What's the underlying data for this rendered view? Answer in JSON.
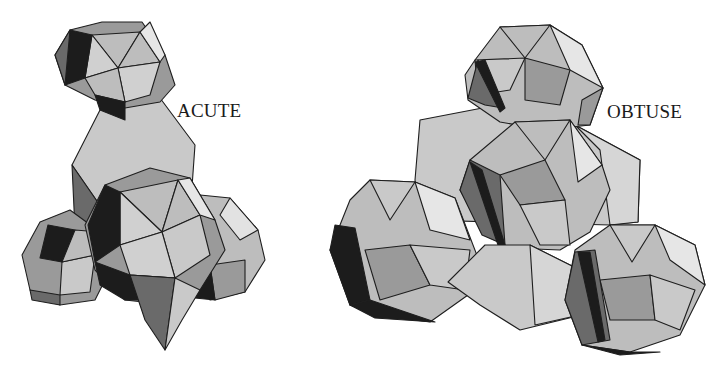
{
  "figures": [
    {
      "id": "acute",
      "label": "ACUTE"
    },
    {
      "id": "obtuse",
      "label": "OBTUSE"
    }
  ],
  "colors": {
    "background": "#ffffff",
    "face_light": "#e2e2e2",
    "face_mid": "#bdbdbd",
    "face_grey": "#9a9a9a",
    "face_dark": "#6a6a6a",
    "face_black": "#1c1c1c",
    "edge": "#1e1e1e"
  }
}
